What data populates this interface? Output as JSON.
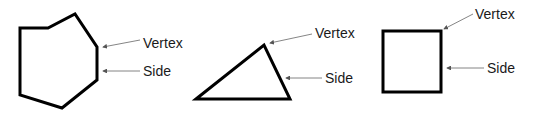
{
  "figures": [
    {
      "shape": "heptagon",
      "points": "20,28 48,28 75,14 97,47 97,80 62,108 20,95",
      "labels": {
        "vertex": {
          "text": "Vertex",
          "x": 143,
          "y": 36,
          "arrow": [
            140,
            40,
            103,
            47
          ]
        },
        "side": {
          "text": "Side",
          "x": 143,
          "y": 64,
          "arrow": [
            140,
            71,
            103,
            71
          ]
        }
      }
    },
    {
      "shape": "triangle",
      "points": "196,99 264,45 290,99",
      "labels": {
        "vertex": {
          "text": "Vertex",
          "x": 315,
          "y": 26,
          "arrow": [
            312,
            34,
            270,
            43
          ]
        },
        "side": {
          "text": "Side",
          "x": 325,
          "y": 71,
          "arrow": [
            322,
            78,
            286,
            78
          ]
        }
      }
    },
    {
      "shape": "square",
      "points": "383,31 441,31 441,92 383,92",
      "labels": {
        "vertex": {
          "text": "Vertex",
          "x": 475,
          "y": 7,
          "arrow": [
            473,
            14,
            444,
            29
          ]
        },
        "side": {
          "text": "Side",
          "x": 487,
          "y": 61,
          "arrow": [
            484,
            68,
            447,
            68
          ]
        }
      }
    }
  ]
}
